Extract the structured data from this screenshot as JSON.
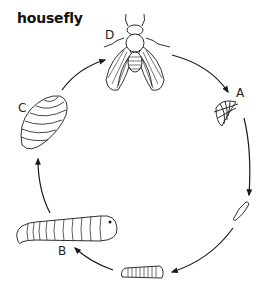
{
  "diagram": {
    "title": "housefly",
    "type": "life-cycle",
    "direction": "clockwise",
    "stages": [
      {
        "label": "D",
        "name": "adult fly",
        "position": "top"
      },
      {
        "label": "A",
        "name": "eggs",
        "position": "upper-right"
      },
      {
        "label": "",
        "name": "hatchling larva",
        "position": "lower-right"
      },
      {
        "label": "",
        "name": "young larva",
        "position": "bottom"
      },
      {
        "label": "B",
        "name": "mature larva",
        "position": "lower-left"
      },
      {
        "label": "C",
        "name": "pupa",
        "position": "left"
      }
    ],
    "colors": {
      "ink": "#1a1a1a",
      "background": "#ffffff"
    }
  }
}
